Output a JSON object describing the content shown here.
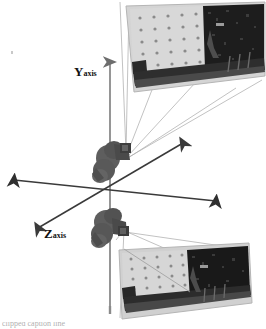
{
  "figure": {
    "background_color": "#ffffff",
    "width": 266,
    "height": 329
  },
  "axes": {
    "y": {
      "name_major": "Y",
      "name_minor": "axis",
      "label": "Yaxis",
      "color": "#6d6d6d",
      "direction": "vertical"
    },
    "z": {
      "name_major": "Z",
      "name_minor": "axis",
      "label": "Zaxis",
      "color": "#3a3a3a",
      "direction": "diagonal-lower-left"
    },
    "x": {
      "name_major": "X",
      "name_minor": "axis",
      "label": "",
      "color": "#3a3a3a",
      "direction": "horizontal"
    },
    "origin": {
      "x": 109,
      "y": 190
    }
  },
  "cameras": [
    {
      "id": "upper-camera",
      "position": {
        "x": 112,
        "y": 152
      },
      "color": "#555555"
    },
    {
      "id": "lower-camera",
      "position": {
        "x": 110,
        "y": 222
      },
      "color": "#555555"
    }
  ],
  "photos": [
    {
      "id": "upper-photo",
      "position": "top-right",
      "panel_color": "#d2d2d2",
      "dark_color": "#1b1b1b",
      "dot_color": "#7d7d7d",
      "dot_rows": 5,
      "dot_cols": 5,
      "border_color": "#b8b8b8"
    },
    {
      "id": "lower-photo",
      "position": "bottom-right",
      "panel_color": "#cfcfcf",
      "dark_color": "#171717",
      "dot_color": "#7d7d7d",
      "dot_rows": 5,
      "dot_cols": 5,
      "border_color": "#b8b8b8"
    }
  ],
  "projection_lines": {
    "color": "#a9a9a9",
    "count": 8
  },
  "caption": {
    "text": "clipped caption line"
  }
}
